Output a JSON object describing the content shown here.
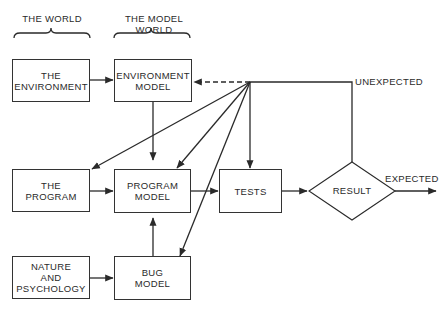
{
  "headers": {
    "world": "THE WORLD",
    "model_world": "THE MODEL WORLD"
  },
  "boxes": {
    "environment": "THE\nENVIRONMENT",
    "environment_model": "ENVIRONMENT\nMODEL",
    "program": "THE\nPROGRAM",
    "program_model": "PROGRAM\nMODEL",
    "nature": "NATURE\nAND\nPSYCHOLOGY",
    "bug_model": "BUG\nMODEL",
    "tests": "TESTS"
  },
  "decision": {
    "result": "RESULT"
  },
  "edge_labels": {
    "unexpected": "UNEXPECTED",
    "expected": "EXPECTED"
  },
  "colors": {
    "line": "#2a2a2a",
    "background": "#ffffff"
  }
}
